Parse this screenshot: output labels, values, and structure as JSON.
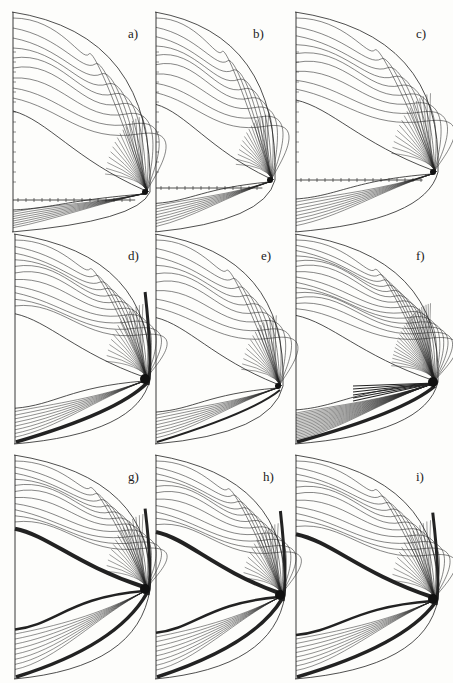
{
  "figure": {
    "panels": [
      {
        "id": "a",
        "label": "a)",
        "x": 12,
        "y": 12,
        "w": 140,
        "h": 220,
        "tip_y": 180,
        "style": "light",
        "axis": true
      },
      {
        "id": "b",
        "label": "b)",
        "x": 155,
        "y": 12,
        "w": 122,
        "h": 220,
        "tip_y": 168,
        "style": "light",
        "axis": true
      },
      {
        "id": "c",
        "label": "c)",
        "x": 295,
        "y": 12,
        "w": 145,
        "h": 220,
        "tip_y": 160,
        "style": "light",
        "axis": true
      },
      {
        "id": "d",
        "label": "d)",
        "x": 14,
        "y": 234,
        "w": 138,
        "h": 210,
        "tip_y": 145,
        "style": "medium",
        "axis": false
      },
      {
        "id": "e",
        "label": "e)",
        "x": 155,
        "y": 234,
        "w": 130,
        "h": 210,
        "tip_y": 152,
        "style": "light",
        "axis": false
      },
      {
        "id": "f",
        "label": "f)",
        "x": 295,
        "y": 234,
        "w": 145,
        "h": 210,
        "tip_y": 148,
        "style": "dense",
        "axis": false
      },
      {
        "id": "g",
        "label": "g)",
        "x": 14,
        "y": 455,
        "w": 138,
        "h": 224,
        "tip_y": 134,
        "style": "shock",
        "axis": false
      },
      {
        "id": "h",
        "label": "h)",
        "x": 155,
        "y": 455,
        "w": 132,
        "h": 224,
        "tip_y": 140,
        "style": "shock",
        "axis": false
      },
      {
        "id": "i",
        "label": "i)",
        "x": 295,
        "y": 455,
        "w": 145,
        "h": 224,
        "tip_y": 144,
        "style": "shock",
        "axis": false
      }
    ]
  }
}
